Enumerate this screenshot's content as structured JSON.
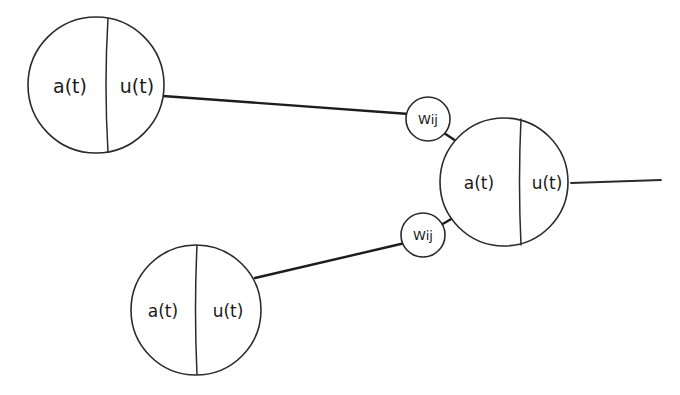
{
  "diagram": {
    "background_color": "#ffffff",
    "stroke_color": "#2b2b2b",
    "edge_color": "#1d1d1d",
    "nodes": [
      {
        "id": "node-top-left",
        "activation_label": "a(t)",
        "output_label": "u(t)",
        "cx": 96,
        "cy": 85,
        "r": 68
      },
      {
        "id": "node-bottom-left",
        "activation_label": "a(t)",
        "output_label": "u(t)",
        "cx": 196,
        "cy": 310,
        "r": 65
      },
      {
        "id": "node-right",
        "activation_label": "a(t)",
        "output_label": "u(t)",
        "cx": 504,
        "cy": 182,
        "r": 64
      }
    ],
    "weights": [
      {
        "id": "weight-upper",
        "label": "Wij",
        "cx": 428,
        "cy": 119,
        "r": 22
      },
      {
        "id": "weight-lower",
        "label": "Wij",
        "cx": 423,
        "cy": 235,
        "r": 22
      }
    ],
    "edges": [
      {
        "id": "edge-top-left-to-weight-upper",
        "from": "node-top-left",
        "to": "weight-upper",
        "x1": 163,
        "y1": 96,
        "x2": 407,
        "y2": 114
      },
      {
        "id": "edge-bottom-left-to-weight-lower",
        "from": "node-bottom-left",
        "to": "weight-lower",
        "x1": 255,
        "y1": 278,
        "x2": 404,
        "y2": 243
      },
      {
        "id": "edge-weight-upper-to-node-right",
        "from": "weight-upper",
        "to": "node-right",
        "x1": 446,
        "y1": 134,
        "x2": 460,
        "y2": 143
      },
      {
        "id": "edge-weight-lower-to-node-right",
        "from": "weight-lower",
        "to": "node-right",
        "x1": 442,
        "y1": 226,
        "x2": 456,
        "y2": 218
      }
    ],
    "output": {
      "id": "output-axon",
      "x1": 573,
      "y1": 183,
      "x2": 661,
      "y2": 180
    }
  }
}
